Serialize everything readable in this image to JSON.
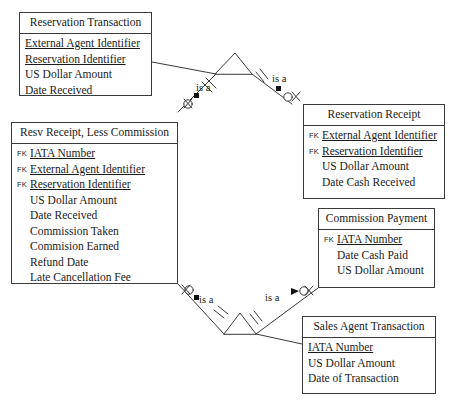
{
  "diagram": {
    "kind": "entity-relationship-diagram",
    "notation": "crows-foot-subtype",
    "background_color": "#ffffff",
    "line_color": "#3a3a3a",
    "text_color": "#1a1a1a"
  },
  "entities": [
    {
      "id": "reservation-transaction",
      "title": "Reservation Transaction",
      "attributes": [
        {
          "tag": "",
          "name": "External Agent Identifier",
          "key": true
        },
        {
          "tag": "",
          "name": "Reservation Identifier",
          "key": true
        },
        {
          "tag": "",
          "name": "US Dollar Amount",
          "key": false
        },
        {
          "tag": "",
          "name": "Date Received",
          "key": false
        }
      ]
    },
    {
      "id": "resv-receipt-less-commission",
      "title": "Resv Receipt, Less Commission",
      "attributes": [
        {
          "tag": "FK",
          "name": "IATA Number",
          "key": true
        },
        {
          "tag": "FK",
          "name": "External Agent Identifier",
          "key": true
        },
        {
          "tag": "FK",
          "name": "Reservation Identifier",
          "key": true
        },
        {
          "tag": "",
          "name": "US Dollar Amount",
          "key": false
        },
        {
          "tag": "",
          "name": "Date Received",
          "key": false
        },
        {
          "tag": "",
          "name": "Commission Taken",
          "key": false
        },
        {
          "tag": "",
          "name": "Commision Earned",
          "key": false
        },
        {
          "tag": "",
          "name": "Refund Date",
          "key": false
        },
        {
          "tag": "",
          "name": "Late Cancellation Fee",
          "key": false
        }
      ]
    },
    {
      "id": "reservation-receipt",
      "title": "Reservation Receipt",
      "attributes": [
        {
          "tag": "FK",
          "name": "External Agent Identifier",
          "key": true
        },
        {
          "tag": "FK",
          "name": "Reservation Identifier",
          "key": true
        },
        {
          "tag": "",
          "name": "US Dollar Amount",
          "key": false
        },
        {
          "tag": "",
          "name": "Date Cash Received",
          "key": false
        }
      ]
    },
    {
      "id": "commission-payment",
      "title": "Commission Payment",
      "attributes": [
        {
          "tag": "FK",
          "name": "IATA Number",
          "key": true
        },
        {
          "tag": "",
          "name": "Date Cash Paid",
          "key": false
        },
        {
          "tag": "",
          "name": "US Dollar Amount",
          "key": false
        }
      ]
    },
    {
      "id": "sales-agent-transaction",
      "title": "Sales Agent Transaction",
      "attributes": [
        {
          "tag": "",
          "name": "IATA Number",
          "key": true
        },
        {
          "tag": "",
          "name": "US Dollar Amount",
          "key": false
        },
        {
          "tag": "",
          "name": "Date of Transaction",
          "key": false
        }
      ]
    }
  ],
  "relationships": [
    {
      "id": "rel-top-left",
      "label": "is a"
    },
    {
      "id": "rel-top-right",
      "label": "is a"
    },
    {
      "id": "rel-bottom-left",
      "label": "is a"
    },
    {
      "id": "rel-bottom-right",
      "label": "is a"
    }
  ]
}
